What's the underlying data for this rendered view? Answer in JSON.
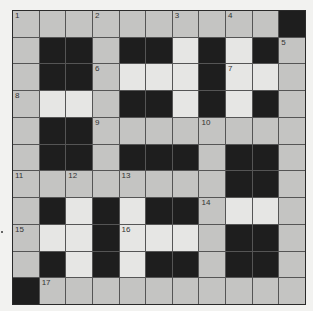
{
  "puzzle": {
    "rows": 11,
    "cols": 11,
    "legend": {
      "g": "light-gray cell",
      "w": "white cell",
      "b": "black block"
    },
    "grid": [
      [
        "g",
        "g",
        "g",
        "g",
        "g",
        "g",
        "g",
        "g",
        "g",
        "g",
        "b"
      ],
      [
        "g",
        "b",
        "b",
        "g",
        "b",
        "b",
        "w",
        "b",
        "w",
        "b",
        "g"
      ],
      [
        "g",
        "b",
        "b",
        "g",
        "w",
        "w",
        "w",
        "b",
        "w",
        "w",
        "g"
      ],
      [
        "g",
        "w",
        "w",
        "g",
        "b",
        "b",
        "w",
        "b",
        "w",
        "b",
        "g"
      ],
      [
        "g",
        "b",
        "b",
        "g",
        "g",
        "g",
        "g",
        "g",
        "g",
        "g",
        "g"
      ],
      [
        "g",
        "b",
        "b",
        "g",
        "b",
        "b",
        "b",
        "g",
        "b",
        "b",
        "g"
      ],
      [
        "g",
        "g",
        "g",
        "g",
        "g",
        "g",
        "g",
        "g",
        "b",
        "b",
        "g"
      ],
      [
        "g",
        "b",
        "w",
        "b",
        "w",
        "b",
        "b",
        "g",
        "w",
        "w",
        "g"
      ],
      [
        "g",
        "w",
        "w",
        "b",
        "w",
        "w",
        "w",
        "g",
        "b",
        "b",
        "g"
      ],
      [
        "g",
        "b",
        "w",
        "b",
        "w",
        "b",
        "b",
        "g",
        "b",
        "b",
        "g"
      ],
      [
        "b",
        "g",
        "g",
        "g",
        "g",
        "g",
        "g",
        "g",
        "g",
        "g",
        "g"
      ]
    ],
    "numbers": [
      {
        "r": 0,
        "c": 0,
        "n": "1"
      },
      {
        "r": 0,
        "c": 3,
        "n": "2"
      },
      {
        "r": 0,
        "c": 6,
        "n": "3"
      },
      {
        "r": 0,
        "c": 8,
        "n": "4"
      },
      {
        "r": 1,
        "c": 10,
        "n": "5"
      },
      {
        "r": 2,
        "c": 3,
        "n": "6"
      },
      {
        "r": 2,
        "c": 8,
        "n": "7"
      },
      {
        "r": 3,
        "c": 0,
        "n": "8"
      },
      {
        "r": 4,
        "c": 3,
        "n": "9"
      },
      {
        "r": 4,
        "c": 7,
        "n": "10"
      },
      {
        "r": 6,
        "c": 0,
        "n": "11"
      },
      {
        "r": 6,
        "c": 2,
        "n": "12"
      },
      {
        "r": 6,
        "c": 4,
        "n": "13"
      },
      {
        "r": 7,
        "c": 7,
        "n": "14"
      },
      {
        "r": 8,
        "c": 0,
        "n": "15"
      },
      {
        "r": 8,
        "c": 4,
        "n": "16"
      },
      {
        "r": 10,
        "c": 1,
        "n": "17"
      }
    ]
  }
}
